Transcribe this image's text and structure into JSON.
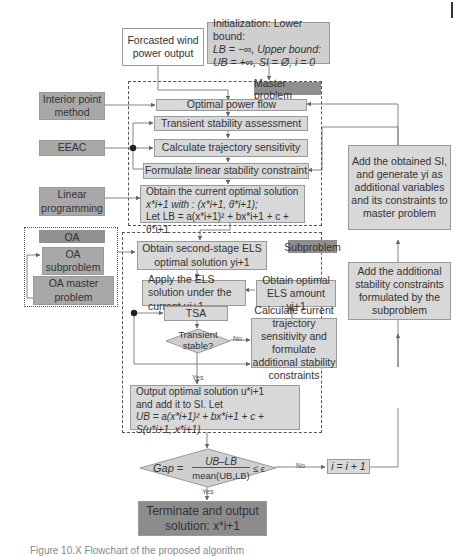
{
  "figure": {
    "caption_partial": "Figure 10.X  Flowchart of the proposed algorithm",
    "colors": {
      "box_fill": "#d8d8d8",
      "method_fill": "#a8a8a8",
      "tag_fill": "#8e8e8e",
      "terminal_fill": "#8c8c8c",
      "line": "#777777"
    }
  },
  "top": {
    "wind_input": "Forcasted wind power output",
    "init_line1": "Initialization: Lower bound:",
    "init_line2": "LB = −∞, Upper bound:",
    "init_line3": "UB = +∞, SI = Ø, i = 0"
  },
  "master": {
    "tag": "Master problem",
    "steps": [
      "Optimal power flow",
      "Transient stability assessment",
      "Calculate trajectory sensitivity",
      "Formulate linear stability constraint"
    ],
    "solution_line1": "Obtain the current optimal solution",
    "solution_line2": "x*i+1 with : (x*i+1, θ*i+1);",
    "solution_line3": "Let LB = a(x*i+1)² + bx*i+1 + c + θ*i+1"
  },
  "methods": {
    "interior_point": "Interior point method",
    "eeac": "EEAC",
    "linear_programming": "Linear programming"
  },
  "oa": {
    "tag": "OA",
    "subproblem": "OA subproblem",
    "master": "OA master problem"
  },
  "subproblem": {
    "tag": "Subproblem",
    "second_stage": "Obtain second-stage ELS optimal solution yi+1",
    "apply_els": "Apply the ELS solution under the current ui+1",
    "obtain_els_amount": "Obtain optimal ELS amount yi+1",
    "tsa": "TSA",
    "decision": "Transient stable?",
    "decision_no": "No",
    "decision_yes": "Yes",
    "calc_current": "Calculate current trajectory sensitivity and formulate additional stability constraints",
    "output_line1": "Output optimal solution u*i+1",
    "output_line2": "and add it to SI. Let",
    "output_line3": "UB = a(x*i+1)² + bx*i+1 + c + S(u*i+1, x*i+1)"
  },
  "right": {
    "add_si": "Add the obtained SI, and generate yi as additional variables and its constraints to master problem",
    "add_constraints": "Add the additional stability constraints formulated by the subproblem"
  },
  "gap": {
    "lhs": "Gap =",
    "numerator": "UB–LB",
    "denominator": "mean(UB,LB)",
    "rhs": "≤ ϵ",
    "no": "No",
    "yes": "Yes",
    "increment": "i = i + 1"
  },
  "terminal": {
    "line1": "Terminate and output",
    "line2": "solution: x*i+1"
  }
}
